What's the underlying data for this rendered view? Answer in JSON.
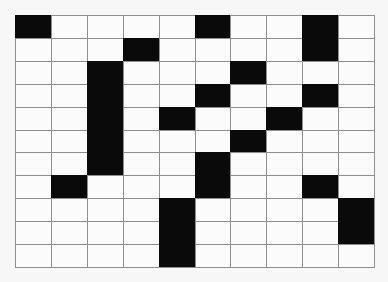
{
  "puzzle": {
    "rows": 11,
    "cols": 10,
    "colors": {
      "filled": "#0a0a0a",
      "empty": "#fbfbfb",
      "gridline": "#8f8f8f",
      "background": "#f7f7f7"
    },
    "filled_cells": [
      [
        0,
        0
      ],
      [
        0,
        5
      ],
      [
        0,
        8
      ],
      [
        1,
        3
      ],
      [
        1,
        8
      ],
      [
        2,
        2
      ],
      [
        2,
        6
      ],
      [
        3,
        2
      ],
      [
        3,
        5
      ],
      [
        3,
        8
      ],
      [
        4,
        2
      ],
      [
        4,
        4
      ],
      [
        4,
        7
      ],
      [
        5,
        2
      ],
      [
        5,
        6
      ],
      [
        6,
        2
      ],
      [
        6,
        5
      ],
      [
        7,
        1
      ],
      [
        7,
        5
      ],
      [
        7,
        8
      ],
      [
        8,
        4
      ],
      [
        8,
        9
      ],
      [
        9,
        4
      ],
      [
        9,
        9
      ],
      [
        10,
        4
      ]
    ]
  }
}
